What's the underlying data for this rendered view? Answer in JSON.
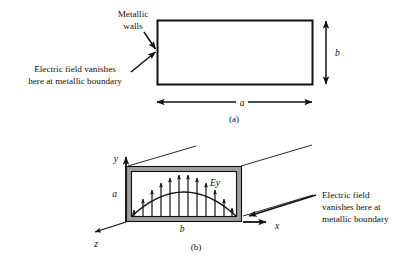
{
  "figure": {
    "background_color": "#ffffff",
    "line_color": "#111111",
    "wall_fill_color": "#9f9f9f"
  },
  "panel_a": {
    "caption": "(a)",
    "annotations": {
      "metallic_walls": {
        "line1": "Metallic",
        "line2": "walls"
      },
      "field_vanishes": {
        "line1": "Electric field vanishes",
        "line2": "here at metallic boundary"
      }
    },
    "dimensions": {
      "width_label": "a",
      "height_label": "b"
    },
    "rect": {
      "x": 157,
      "y": 20,
      "width": 155,
      "height": 64
    }
  },
  "panel_b": {
    "caption": "(b)",
    "axes": {
      "y_label": "y",
      "x_label": "x",
      "z_label": "z"
    },
    "dimensions": {
      "height_label": "a",
      "width_label": "b"
    },
    "field_label": "Ey",
    "annotation": {
      "line1": "Electric field",
      "line2": "vanishes here at",
      "line3": "metallic boundary"
    },
    "box": {
      "x": 126,
      "y": 166,
      "width": 116,
      "height": 56
    },
    "field_arrow_count": 11
  },
  "icons": {
    "arrow_head": "arrowhead-icon",
    "dimension_arrow": "double-arrow-icon",
    "pointer_arrow": "pointer-arrow-icon"
  }
}
